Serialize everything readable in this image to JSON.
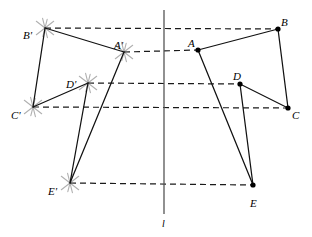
{
  "figure": {
    "width": 312,
    "height": 237,
    "background": "#ffffff",
    "stroke_color": "#111111",
    "dash_color": "#1a1a1a",
    "arc_color": "#b0b0b0",
    "mirror_line": {
      "name": "l",
      "label": "l",
      "x": 164,
      "y_top": 10,
      "y_bottom": 214,
      "label_x": 162,
      "label_y": 219
    },
    "original_polygon": {
      "name": "ABCDE",
      "vertices": [
        {
          "id": "A",
          "label": "A",
          "x": 198,
          "y": 50,
          "label_x": 188,
          "label_y": 38
        },
        {
          "id": "B",
          "label": "B",
          "x": 278,
          "y": 29,
          "label_x": 281,
          "label_y": 17
        },
        {
          "id": "C",
          "label": "C",
          "x": 288,
          "y": 108,
          "label_x": 292,
          "label_y": 110
        },
        {
          "id": "D",
          "label": "D",
          "x": 240,
          "y": 84,
          "label_x": 233,
          "label_y": 71
        },
        {
          "id": "E",
          "label": "E",
          "x": 253,
          "y": 185,
          "label_x": 250,
          "label_y": 198
        }
      ],
      "edges": [
        [
          "A",
          "B"
        ],
        [
          "B",
          "C"
        ],
        [
          "C",
          "D"
        ],
        [
          "D",
          "E"
        ],
        [
          "E",
          "A"
        ]
      ]
    },
    "image_polygon": {
      "name": "A'B'C'D'E'",
      "vertices": [
        {
          "id": "Ap",
          "label": "A'",
          "x": 124,
          "y": 52,
          "label_x": 114,
          "label_y": 40
        },
        {
          "id": "Bp",
          "label": "B'",
          "x": 45,
          "y": 28,
          "label_x": 23,
          "label_y": 30
        },
        {
          "id": "Cp",
          "label": "C'",
          "x": 33,
          "y": 107,
          "label_x": 11,
          "label_y": 110
        },
        {
          "id": "Dp",
          "label": "D'",
          "x": 88,
          "y": 83,
          "label_x": 66,
          "label_y": 79
        },
        {
          "id": "Ep",
          "label": "E'",
          "x": 70,
          "y": 183,
          "label_x": 48,
          "label_y": 186
        }
      ],
      "edges": [
        [
          "Ap",
          "Bp"
        ],
        [
          "Bp",
          "Cp"
        ],
        [
          "Cp",
          "Dp"
        ],
        [
          "Dp",
          "Ep"
        ],
        [
          "Ep",
          "Ap"
        ]
      ]
    },
    "construction_lines": [
      {
        "name": "B-to-Bprime",
        "x1": 45,
        "y1": 28,
        "x2": 278,
        "y2": 29
      },
      {
        "name": "A-to-Aprime",
        "x1": 124,
        "y1": 52,
        "x2": 198,
        "y2": 50
      },
      {
        "name": "D-to-Dprime",
        "x1": 88,
        "y1": 83,
        "x2": 240,
        "y2": 84
      },
      {
        "name": "C-to-Cprime",
        "x1": 33,
        "y1": 107,
        "x2": 288,
        "y2": 108
      },
      {
        "name": "E-to-Eprime",
        "x1": 70,
        "y1": 183,
        "x2": 253,
        "y2": 185
      }
    ],
    "compass_marks": [
      {
        "name": "arc-mark-Aprime",
        "x": 124,
        "y": 52
      },
      {
        "name": "arc-mark-Bprime",
        "x": 45,
        "y": 28
      },
      {
        "name": "arc-mark-Cprime",
        "x": 33,
        "y": 107
      },
      {
        "name": "arc-mark-Dprime",
        "x": 88,
        "y": 83
      },
      {
        "name": "arc-mark-Eprime",
        "x": 70,
        "y": 183
      }
    ]
  }
}
